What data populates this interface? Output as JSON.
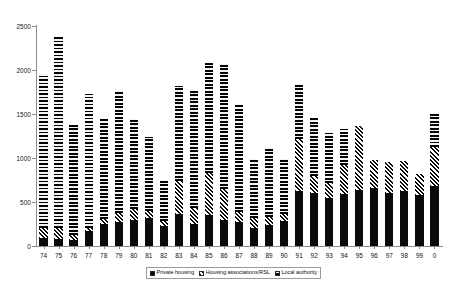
{
  "chart_data": {
    "type": "bar",
    "subtype": "stacked-bar",
    "title": "",
    "subtitle": "",
    "xlabel": "",
    "ylabel": "",
    "ylim": [
      0,
      2500
    ],
    "ytick_values": [
      0,
      500,
      1000,
      1500,
      2000,
      2500
    ],
    "ytick_labels": [
      "0",
      "500",
      "1000",
      "1500",
      "2000",
      "2500"
    ],
    "grid": false,
    "legend_position": "bottom",
    "categories": [
      "74",
      "75",
      "76",
      "77",
      "78",
      "79",
      "80",
      "81",
      "82",
      "83",
      "84",
      "85",
      "86",
      "87",
      "88",
      "89",
      "90",
      "91",
      "92",
      "93",
      "94",
      "95",
      "96",
      "97",
      "98",
      "99",
      "0"
    ],
    "series": [
      {
        "name": "Private housing",
        "swatch": "solid-black",
        "color": "#0a0a0a",
        "values": [
          90,
          80,
          70,
          170,
          250,
          270,
          300,
          320,
          230,
          360,
          250,
          350,
          300,
          270,
          210,
          240,
          280,
          620,
          600,
          540,
          590,
          640,
          660,
          600,
          620,
          580,
          680
        ]
      },
      {
        "name": "Housing associations/RSL",
        "swatch": "diagonal-stripe",
        "color": "#0a0a0a",
        "values": [
          110,
          120,
          60,
          40,
          60,
          110,
          120,
          80,
          60,
          380,
          180,
          480,
          350,
          120,
          110,
          90,
          80,
          600,
          200,
          180,
          330,
          720,
          320,
          360,
          350,
          240,
          450
        ]
      },
      {
        "name": "Local authority",
        "swatch": "dark-checker",
        "color": "#4c4c4c",
        "values": [
          1750,
          2180,
          1250,
          1520,
          1130,
          1380,
          1020,
          840,
          460,
          1080,
          1360,
          1250,
          1420,
          1220,
          670,
          790,
          630,
          620,
          660,
          560,
          410,
          0,
          0,
          0,
          0,
          0,
          380
        ]
      }
    ],
    "totals": [
      1950,
      2380,
      1380,
      1730,
      1440,
      1760,
      1440,
      1240,
      750,
      1820,
      1790,
      2080,
      2070,
      1610,
      990,
      1120,
      990,
      1840,
      1460,
      1280,
      1330,
      1360,
      980,
      960,
      970,
      820,
      1510
    ]
  },
  "legend": {
    "items": [
      {
        "label": "Private housing"
      },
      {
        "label": "Housing associations/RSL"
      },
      {
        "label": "Local authority"
      }
    ]
  }
}
